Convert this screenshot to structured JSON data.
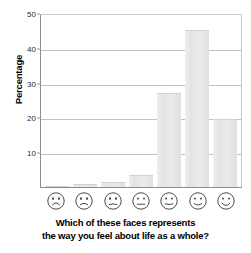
{
  "chart_data": {
    "type": "bar",
    "title": "",
    "subtitle": "",
    "xlabel": "Which of these faces represents the way you feel about life as a whole?",
    "ylabel": "Percentage",
    "ylim": [
      0,
      50
    ],
    "yticks": [
      10,
      20,
      30,
      40,
      50
    ],
    "grid": true,
    "legend": "none",
    "categories": [
      "very unhappy face",
      "unhappy face",
      "slightly unhappy face",
      "neutral face",
      "slightly happy face",
      "happy face",
      "very happy face"
    ],
    "values": [
      0.3,
      1,
      1.5,
      3.5,
      27,
      45,
      19.5
    ],
    "bar_color": "#e6e6e6",
    "grid_color": "#c2c2c2",
    "axis_color": "#8d8d8d"
  },
  "axis": {
    "y_title": "Percentage",
    "tick_labels": [
      "10",
      "20",
      "30",
      "40",
      "50"
    ]
  },
  "caption": {
    "line1": "Which of these faces represents",
    "line2": "the way you feel about life as a whole?"
  },
  "faces": [
    {
      "name": "face-very-unhappy",
      "mood": "very unhappy"
    },
    {
      "name": "face-unhappy",
      "mood": "unhappy"
    },
    {
      "name": "face-slightly-unhappy",
      "mood": "slightly unhappy"
    },
    {
      "name": "face-neutral",
      "mood": "neutral"
    },
    {
      "name": "face-slightly-happy",
      "mood": "slightly happy"
    },
    {
      "name": "face-happy",
      "mood": "happy"
    },
    {
      "name": "face-very-happy",
      "mood": "very happy"
    }
  ]
}
